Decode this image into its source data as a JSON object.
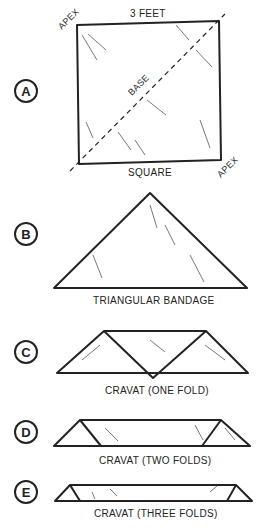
{
  "figure": {
    "panels": [
      {
        "letter": "A",
        "caption": "SQUARE",
        "top_label": "3 FEET",
        "apex_label_1": "APEX",
        "apex_label_2": "APEX",
        "diagonal_label": "BASE"
      },
      {
        "letter": "B",
        "caption": "TRIANGULAR BANDAGE"
      },
      {
        "letter": "C",
        "caption": "CRAVAT (ONE FOLD)"
      },
      {
        "letter": "D",
        "caption": "CRAVAT (TWO FOLDS)"
      },
      {
        "letter": "E",
        "caption": "CRAVAT (THREE FOLDS)"
      }
    ]
  }
}
